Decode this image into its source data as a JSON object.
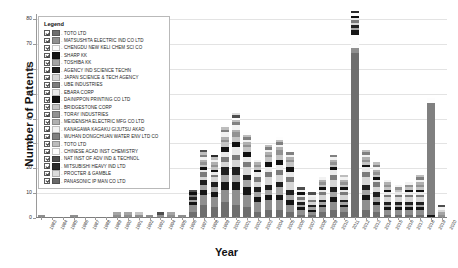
{
  "chart_data": {
    "type": "bar",
    "title": "",
    "xlabel": "Year",
    "ylabel": "Number of Patents",
    "ylim": [
      0,
      82
    ],
    "yticks": [
      0,
      10,
      20,
      30,
      40,
      50,
      60,
      70,
      80
    ],
    "grid": true,
    "stacked": true,
    "legend_position": "upper-left-inset",
    "legend_title": "Legend",
    "categories": [
      "1983",
      "1984",
      "1985",
      "1986",
      "1987",
      "1988",
      "1989",
      "1990",
      "1991",
      "1992",
      "1993",
      "1994",
      "1995",
      "1996",
      "1997",
      "1998",
      "1999",
      "2000",
      "2001",
      "2002",
      "2003",
      "2004",
      "2005",
      "2006",
      "2007",
      "2008",
      "2009",
      "2010",
      "2011",
      "2012",
      "2013",
      "2014",
      "2015",
      "2016",
      "2017",
      "2018",
      "2019",
      "2020"
    ],
    "totals": [
      1,
      0,
      0,
      1,
      0,
      0,
      0,
      3,
      2,
      2,
      1,
      2,
      3,
      1,
      11,
      27,
      24,
      37,
      40,
      34,
      23,
      29,
      32,
      26,
      12,
      10,
      15,
      25,
      17,
      82,
      27,
      22,
      15,
      13,
      14,
      16,
      48,
      5
    ],
    "series": [
      {
        "name": "TOTO LTD",
        "color": "#6e6e6e",
        "values": [
          0,
          0,
          0,
          0,
          0,
          0,
          0,
          0,
          0,
          0,
          0,
          0,
          0,
          0,
          2,
          5,
          4,
          6,
          5,
          4,
          2,
          3,
          3,
          2,
          1,
          1,
          2,
          3,
          2,
          66,
          3,
          2,
          1,
          1,
          1,
          1,
          0,
          0
        ]
      },
      {
        "name": "MATSUSHITA ELECTRIC IND CO LTD",
        "color": "#8f8f8f",
        "values": [
          1,
          0,
          0,
          1,
          0,
          0,
          0,
          1,
          1,
          1,
          1,
          1,
          1,
          1,
          3,
          4,
          4,
          5,
          6,
          5,
          4,
          4,
          4,
          3,
          2,
          1,
          2,
          3,
          2,
          2,
          4,
          3,
          2,
          2,
          2,
          2,
          0,
          1
        ]
      },
      {
        "name": "CHENGDU NEW KELI CHEM SCI CO",
        "color": "#fbfbfb",
        "values": [
          0,
          0,
          0,
          0,
          0,
          0,
          0,
          0,
          0,
          0,
          0,
          0,
          0,
          0,
          0,
          0,
          0,
          0,
          0,
          0,
          0,
          0,
          0,
          0,
          0,
          0,
          0,
          0,
          0,
          5,
          0,
          0,
          0,
          0,
          0,
          0,
          0,
          0
        ]
      },
      {
        "name": "SHARP KK",
        "color": "#151515",
        "values": [
          0,
          0,
          0,
          0,
          0,
          0,
          0,
          0,
          0,
          0,
          0,
          0,
          0,
          0,
          1,
          2,
          2,
          3,
          3,
          3,
          2,
          2,
          2,
          2,
          1,
          1,
          1,
          2,
          1,
          2,
          2,
          1,
          1,
          1,
          1,
          1,
          1,
          0
        ]
      },
      {
        "name": "TOSHIBA KK",
        "color": "#a5a5a5",
        "values": [
          0,
          0,
          0,
          0,
          0,
          0,
          0,
          1,
          1,
          0,
          0,
          0,
          1,
          0,
          1,
          2,
          2,
          3,
          3,
          3,
          2,
          2,
          3,
          2,
          1,
          1,
          1,
          2,
          1,
          1,
          2,
          2,
          1,
          1,
          1,
          1,
          0,
          1
        ]
      },
      {
        "name": "AGENCY IND SCIENCE TECHN",
        "color": "#1f1f1f",
        "values": [
          0,
          0,
          0,
          0,
          0,
          0,
          0,
          0,
          0,
          0,
          0,
          0,
          0,
          0,
          1,
          2,
          2,
          3,
          3,
          2,
          2,
          2,
          2,
          2,
          1,
          1,
          1,
          2,
          1,
          1,
          2,
          2,
          1,
          1,
          1,
          1,
          0,
          0
        ]
      },
      {
        "name": "JAPAN SCIENCE & TECH AGENCY",
        "color": "#d6d6d6",
        "values": [
          0,
          0,
          0,
          0,
          0,
          0,
          0,
          0,
          0,
          0,
          0,
          0,
          0,
          0,
          0,
          1,
          2,
          2,
          3,
          3,
          2,
          3,
          3,
          3,
          1,
          1,
          2,
          3,
          2,
          1,
          3,
          2,
          2,
          2,
          2,
          2,
          0,
          1
        ]
      },
      {
        "name": "UBE INDUSTRIES",
        "color": "#7b7b7b",
        "values": [
          0,
          0,
          0,
          0,
          0,
          0,
          0,
          0,
          0,
          0,
          0,
          0,
          0,
          0,
          1,
          2,
          1,
          2,
          2,
          2,
          2,
          2,
          2,
          2,
          1,
          1,
          1,
          2,
          1,
          1,
          2,
          2,
          1,
          1,
          1,
          1,
          0,
          0
        ]
      },
      {
        "name": "EBARA CORP",
        "color": "#e9e9e9",
        "values": [
          0,
          0,
          0,
          0,
          0,
          0,
          0,
          0,
          0,
          0,
          0,
          0,
          0,
          0,
          0,
          1,
          1,
          2,
          3,
          2,
          2,
          2,
          2,
          2,
          1,
          1,
          1,
          2,
          1,
          1,
          2,
          1,
          1,
          1,
          1,
          1,
          0,
          0
        ]
      },
      {
        "name": "DAINIPPON PRINTING CO LTD",
        "color": "#101010",
        "values": [
          0,
          0,
          0,
          0,
          0,
          0,
          0,
          0,
          0,
          0,
          0,
          0,
          0,
          0,
          1,
          1,
          1,
          2,
          2,
          2,
          1,
          2,
          2,
          2,
          1,
          0,
          1,
          1,
          1,
          1,
          1,
          1,
          1,
          0,
          1,
          1,
          0,
          0
        ]
      },
      {
        "name": "BRIDGESTONE CORP",
        "color": "#c4c4c4",
        "values": [
          0,
          0,
          0,
          0,
          0,
          0,
          0,
          0,
          0,
          1,
          0,
          0,
          0,
          0,
          0,
          1,
          1,
          2,
          2,
          2,
          1,
          2,
          2,
          2,
          0,
          0,
          1,
          1,
          1,
          0,
          1,
          1,
          1,
          1,
          1,
          1,
          0,
          0
        ]
      },
      {
        "name": "TORAY INDUSTRIES",
        "color": "#929292",
        "values": [
          0,
          0,
          0,
          0,
          0,
          0,
          0,
          0,
          0,
          0,
          0,
          0,
          0,
          0,
          0,
          1,
          1,
          1,
          2,
          1,
          1,
          1,
          2,
          1,
          0,
          0,
          1,
          1,
          1,
          0,
          1,
          1,
          1,
          1,
          1,
          1,
          0,
          0
        ]
      },
      {
        "name": "MEIDENSHA ELECTRIC MFG CO LTD",
        "color": "#b0b0b0",
        "values": [
          0,
          0,
          0,
          0,
          0,
          0,
          0,
          0,
          0,
          0,
          0,
          0,
          0,
          0,
          0,
          1,
          1,
          1,
          1,
          1,
          1,
          1,
          1,
          1,
          0,
          0,
          1,
          1,
          1,
          0,
          1,
          1,
          1,
          0,
          0,
          1,
          0,
          0
        ]
      },
      {
        "name": "KANAGAWA KAGAKU GIJUTSU AKAD",
        "color": "#f2f2f2",
        "values": [
          0,
          0,
          0,
          0,
          0,
          0,
          0,
          0,
          0,
          0,
          0,
          0,
          0,
          0,
          0,
          1,
          1,
          2,
          2,
          1,
          1,
          1,
          1,
          1,
          1,
          1,
          1,
          1,
          1,
          0,
          1,
          1,
          1,
          1,
          1,
          1,
          0,
          1
        ]
      },
      {
        "name": "WUHAN DONGCHUAN WATER ENV LTD CO",
        "color": "#808080",
        "values": [
          0,
          0,
          0,
          0,
          0,
          0,
          0,
          0,
          0,
          0,
          0,
          0,
          0,
          0,
          0,
          1,
          0,
          1,
          1,
          1,
          0,
          1,
          1,
          1,
          0,
          0,
          0,
          1,
          0,
          0,
          1,
          1,
          0,
          0,
          0,
          1,
          45,
          0
        ]
      },
      {
        "name": "TOTO LTD",
        "color": "#bdbdbd",
        "values": [
          0,
          0,
          0,
          0,
          0,
          0,
          0,
          0,
          0,
          0,
          0,
          0,
          0,
          0,
          0,
          1,
          1,
          1,
          1,
          1,
          0,
          1,
          1,
          0,
          0,
          0,
          0,
          0,
          1,
          0,
          1,
          1,
          0,
          0,
          0,
          1,
          0,
          0
        ]
      },
      {
        "name": "CHINESE ACAD INST CHEMISTRY",
        "color": "#fdfdfd",
        "values": [
          0,
          0,
          0,
          0,
          0,
          0,
          0,
          0,
          0,
          0,
          0,
          0,
          0,
          0,
          0,
          0,
          0,
          1,
          1,
          1,
          0,
          0,
          1,
          0,
          0,
          0,
          0,
          0,
          0,
          1,
          0,
          0,
          0,
          0,
          0,
          0,
          2,
          0
        ]
      },
      {
        "name": "NAT INST OF ADV IND & TECHNOL",
        "color": "#4e4e4e",
        "values": [
          0,
          0,
          0,
          0,
          0,
          0,
          0,
          0,
          0,
          0,
          0,
          1,
          0,
          0,
          1,
          1,
          0,
          0,
          1,
          0,
          0,
          0,
          0,
          0,
          1,
          1,
          0,
          0,
          0,
          0,
          0,
          0,
          0,
          0,
          0,
          0,
          0,
          1
        ]
      },
      {
        "name": "MITSUBISHI HEAVY IND LTD",
        "color": "#2b2b2b",
        "values": [
          0,
          0,
          0,
          0,
          0,
          0,
          0,
          0,
          0,
          0,
          0,
          0,
          0,
          0,
          0,
          0,
          1,
          0,
          0,
          0,
          0,
          0,
          0,
          0,
          0,
          0,
          0,
          0,
          0,
          1,
          0,
          0,
          0,
          0,
          0,
          0,
          0,
          0
        ]
      },
      {
        "name": "PROCTER & GAMBLE",
        "color": "#dcdcdc",
        "values": [
          0,
          0,
          0,
          0,
          0,
          0,
          0,
          0,
          0,
          0,
          0,
          0,
          0,
          0,
          0,
          0,
          0,
          0,
          1,
          0,
          0,
          0,
          0,
          0,
          0,
          0,
          0,
          0,
          0,
          0,
          0,
          0,
          0,
          0,
          0,
          0,
          0,
          0
        ]
      },
      {
        "name": "PANASONIC IP MAN CO LTD",
        "color": "#6a6a6a",
        "values": [
          0,
          0,
          0,
          0,
          0,
          0,
          0,
          0,
          0,
          0,
          0,
          0,
          0,
          0,
          0,
          0,
          0,
          0,
          0,
          0,
          0,
          0,
          0,
          0,
          0,
          0,
          0,
          0,
          0,
          0,
          0,
          0,
          0,
          0,
          0,
          0,
          0,
          0
        ]
      }
    ]
  },
  "legend": {
    "title": "Legend",
    "items": [
      {
        "label": "TOTO LTD",
        "color": "#6e6e6e",
        "checked": true
      },
      {
        "label": "MATSUSHITA ELECTRIC IND CO LTD",
        "color": "#8f8f8f",
        "checked": true
      },
      {
        "label": "CHENGDU NEW KELI CHEM SCI CO",
        "color": "#fbfbfb",
        "checked": true
      },
      {
        "label": "SHARP KK",
        "color": "#151515",
        "checked": true
      },
      {
        "label": "TOSHIBA KK",
        "color": "#a5a5a5",
        "checked": true
      },
      {
        "label": "AGENCY IND SCIENCE TECHN",
        "color": "#1f1f1f",
        "checked": true
      },
      {
        "label": "JAPAN SCIENCE & TECH AGENCY",
        "color": "#d6d6d6",
        "checked": true
      },
      {
        "label": "UBE INDUSTRIES",
        "color": "#7b7b7b",
        "checked": true
      },
      {
        "label": "EBARA CORP",
        "color": "#e9e9e9",
        "checked": true
      },
      {
        "label": "DAINIPPON PRINTING CO LTD",
        "color": "#101010",
        "checked": true
      },
      {
        "label": "BRIDGESTONE CORP",
        "color": "#c4c4c4",
        "checked": true
      },
      {
        "label": "TORAY INDUSTRIES",
        "color": "#929292",
        "checked": true
      },
      {
        "label": "MEIDENSHA ELECTRIC MFG CO LTD",
        "color": "#b0b0b0",
        "checked": true
      },
      {
        "label": "KANAGAWA KAGAKU GIJUTSU AKAD",
        "color": "#f2f2f2",
        "checked": true
      },
      {
        "label": "WUHAN DONGCHUAN WATER ENV LTD CO",
        "color": "#808080",
        "checked": true
      },
      {
        "label": "TOTO LTD",
        "color": "#bdbdbd",
        "checked": true
      },
      {
        "label": "CHINESE ACAD INST CHEMISTRY",
        "color": "#fdfdfd",
        "checked": true
      },
      {
        "label": "NAT INST OF ADV IND & TECHNOL",
        "color": "#4e4e4e",
        "checked": true
      },
      {
        "label": "MITSUBISHI HEAVY IND LTD",
        "color": "#2b2b2b",
        "checked": true
      },
      {
        "label": "PROCTER & GAMBLE",
        "color": "#dcdcdc",
        "checked": true
      },
      {
        "label": "PANASONIC IP MAN CO LTD",
        "color": "#6a6a6a",
        "checked": true
      }
    ]
  }
}
